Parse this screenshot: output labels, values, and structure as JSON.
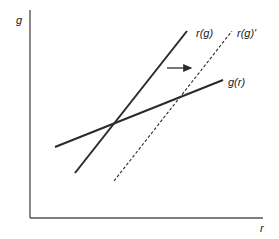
{
  "diagram": {
    "axes": {
      "y_label": "g",
      "x_label": "r"
    },
    "curves": [
      {
        "id": "r_g",
        "label": "r(g)",
        "style": "solid",
        "x1": 75,
        "y1": 173,
        "x2": 187,
        "y2": 31
      },
      {
        "id": "r_g_prime",
        "label": "r(g)'",
        "style": "dashed",
        "x1": 114,
        "y1": 181,
        "x2": 232,
        "y2": 31
      },
      {
        "id": "g_r",
        "label": "g(r)",
        "style": "solid",
        "x1": 55,
        "y1": 147,
        "x2": 223,
        "y2": 80
      }
    ],
    "shift_arrow": {
      "direction": "right",
      "x1": 167,
      "y1": 68,
      "x2": 193,
      "y2": 68
    },
    "colors": {
      "line": "#2a2a2a",
      "axis": "#555555"
    }
  }
}
